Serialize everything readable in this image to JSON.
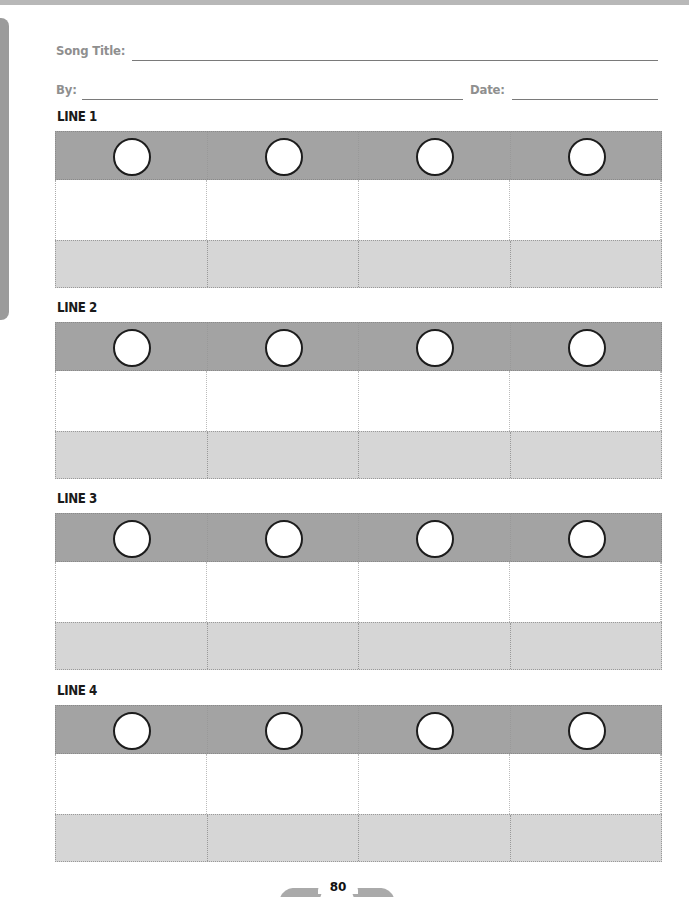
{
  "header": {
    "song_title_label": "Song Title:",
    "song_title_value": "",
    "by_label": "By:",
    "by_value": "",
    "date_label": "Date:",
    "date_value": ""
  },
  "lines": [
    {
      "label": "LINE 1",
      "columns": 4
    },
    {
      "label": "LINE 2",
      "columns": 4
    },
    {
      "label": "LINE 3",
      "columns": 4
    },
    {
      "label": "LINE 4",
      "columns": 4
    }
  ],
  "footer": {
    "page_number": "80"
  },
  "colors": {
    "dark_row": "#a3a3a3",
    "light_row": "#d6d6d6",
    "label_text": "#8f8f8f"
  }
}
